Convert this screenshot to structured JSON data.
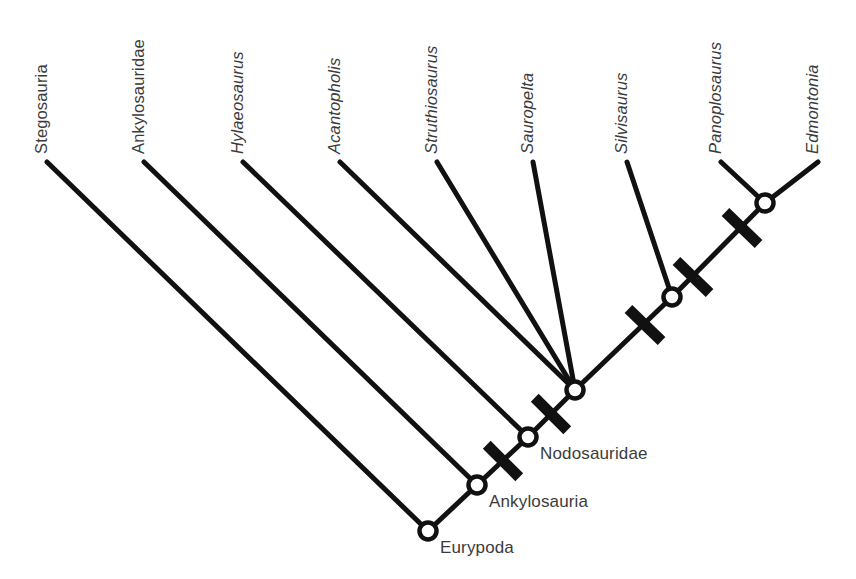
{
  "figure": {
    "type": "cladogram",
    "title": "",
    "width": 856,
    "height": 579,
    "background_color": "#ffffff",
    "line_color": "#111111",
    "text_color": "#3b3b3b",
    "node_fill_color": "#ffffff"
  },
  "chart_data": {
    "type": "diagram",
    "diagram_kind": "cladogram",
    "orientation": "tips-top, root-bottom-left",
    "taxa": [
      {
        "id": "stegosauria",
        "label": "Stegosauria",
        "italic": false,
        "tip_x": 47,
        "tip_y": 162,
        "attach_node": "eurypoda"
      },
      {
        "id": "ankylosauridae",
        "label": "Ankylosauridae",
        "italic": false,
        "tip_x": 144,
        "tip_y": 162,
        "attach_node": "ankylosauria"
      },
      {
        "id": "hylaeosaurus",
        "label": "Hylaeosaurus",
        "italic": true,
        "tip_x": 243,
        "tip_y": 162,
        "attach_node": "nodosauridae"
      },
      {
        "id": "acanthopholis",
        "label": "Acantopholis",
        "italic": true,
        "tip_x": 340,
        "tip_y": 162,
        "attach_node": "polytomy"
      },
      {
        "id": "struthiosaurus",
        "label": "Struthiosaurus",
        "italic": true,
        "tip_x": 437,
        "tip_y": 162,
        "attach_node": "polytomy"
      },
      {
        "id": "sauropelta",
        "label": "Sauropelta",
        "italic": true,
        "tip_x": 533,
        "tip_y": 162,
        "attach_node": "polytomy"
      },
      {
        "id": "silvisaurus",
        "label": "Silvisaurus",
        "italic": true,
        "tip_x": 627,
        "tip_y": 162,
        "attach_node": "silvisaurus_node"
      },
      {
        "id": "panoplosaurus",
        "label": "Panoplosaurus",
        "italic": true,
        "tip_x": 721,
        "tip_y": 162,
        "attach_node": "crown_node"
      },
      {
        "id": "edmontonia",
        "label": "Edmontonia",
        "italic": true,
        "tip_x": 818,
        "tip_y": 162,
        "attach_node": "crown_node"
      }
    ],
    "nodes": [
      {
        "id": "eurypoda",
        "label": "Eurypoda",
        "x": 428,
        "y": 531,
        "labelled": true,
        "label_dx": 12,
        "label_dy": 22
      },
      {
        "id": "ankylosauria",
        "label": "Ankylosauria",
        "x": 477,
        "y": 485,
        "labelled": true,
        "label_dx": 12,
        "label_dy": 22
      },
      {
        "id": "nodosauridae",
        "label": "Nodosauridae",
        "x": 528,
        "y": 437,
        "labelled": true,
        "label_dx": 12,
        "label_dy": 22
      },
      {
        "id": "polytomy",
        "label": "",
        "x": 575,
        "y": 390,
        "labelled": false,
        "label_dx": 0,
        "label_dy": 0
      },
      {
        "id": "silvisaurus_node",
        "label": "",
        "x": 672,
        "y": 297,
        "labelled": false,
        "label_dx": 0,
        "label_dy": 0
      },
      {
        "id": "crown_node",
        "label": "",
        "x": 765,
        "y": 203,
        "labelled": false,
        "label_dx": 0,
        "label_dy": 0
      }
    ],
    "spine_segments": [
      {
        "from": "eurypoda",
        "to": "ankylosauria"
      },
      {
        "from": "ankylosauria",
        "to": "nodosauridae"
      },
      {
        "from": "nodosauridae",
        "to": "polytomy"
      },
      {
        "from": "polytomy",
        "to": "silvisaurus_node"
      },
      {
        "from": "silvisaurus_node",
        "to": "crown_node"
      }
    ],
    "tick_marks": [
      {
        "id": "tick-ankylosauria-nodosauridae",
        "x": 503,
        "y": 461,
        "angle_deg": 45,
        "length": 46
      },
      {
        "id": "tick-nodosauridae-polytomy",
        "x": 551,
        "y": 414,
        "angle_deg": 45,
        "length": 46
      },
      {
        "id": "tick-polytomy-silvisaurus",
        "x": 645,
        "y": 325,
        "angle_deg": 44,
        "length": 46
      },
      {
        "id": "tick-silvisaurus-crown",
        "x": 693,
        "y": 277,
        "angle_deg": 44,
        "length": 46
      },
      {
        "id": "tick-crown-upper",
        "x": 742,
        "y": 228,
        "angle_deg": 44,
        "length": 46
      }
    ],
    "node_label_count": 3,
    "tip_count": 9,
    "tick_count": 5
  }
}
